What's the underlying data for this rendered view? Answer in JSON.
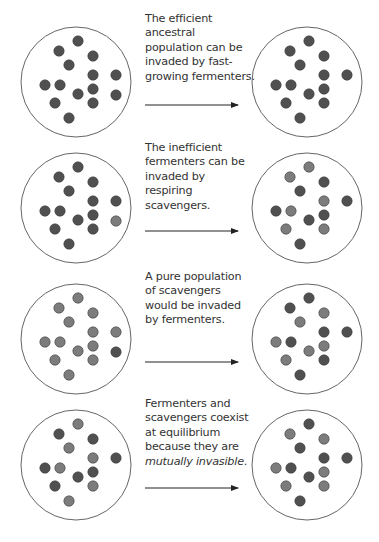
{
  "colors": {
    "fermenter": "#505050",
    "scavenger": "#7c7c7c",
    "circle_stroke": "#666666",
    "arrow": "#222222"
  },
  "layout": {
    "left_cx": 76,
    "right_cx": 307,
    "row_cy": [
      82,
      208,
      339,
      465
    ],
    "circle_r": 55,
    "dot_r": 5.2,
    "arrow_x1": 145,
    "arrow_x2": 238,
    "arrow_dy": 23,
    "caption_top": [
      12,
      141,
      270,
      397
    ]
  },
  "positions": [
    [
      2,
      -41
    ],
    [
      -17,
      -31
    ],
    [
      17,
      -26
    ],
    [
      -7,
      -17
    ],
    [
      17,
      -7
    ],
    [
      40,
      -7
    ],
    [
      -31,
      3
    ],
    [
      -16,
      3
    ],
    [
      2,
      12
    ],
    [
      17,
      7
    ],
    [
      40,
      13
    ],
    [
      -21,
      21
    ],
    [
      17,
      21
    ],
    [
      -7,
      36
    ]
  ],
  "rows": [
    {
      "caption": {
        "lines": [
          "The efficient",
          "ancestral",
          "population can be",
          "invaded by fast-",
          "growing fermenters."
        ],
        "italic_line": -1
      },
      "left": [
        "F",
        "F",
        "F",
        "F",
        "F",
        "F",
        "F",
        "F",
        "F",
        "F",
        "F",
        "F",
        "F",
        "F"
      ],
      "right": [
        "F",
        "F",
        "F",
        "F",
        "F",
        "F",
        "F",
        "F",
        "F",
        "F",
        "-",
        "F",
        "F",
        "F"
      ]
    },
    {
      "caption": {
        "lines": [
          "The inefficient",
          "fermenters can be",
          "invaded by",
          "respiring",
          "scavengers."
        ],
        "italic_line": -1
      },
      "left": [
        "F",
        "F",
        "F",
        "F",
        "F",
        "F",
        "F",
        "F",
        "F",
        "F",
        "S",
        "F",
        "F",
        "F"
      ],
      "right": [
        "S",
        "S",
        "F",
        "F",
        "S",
        "F",
        "F",
        "S",
        "F",
        "F",
        "-",
        "S",
        "S",
        "F"
      ]
    },
    {
      "caption": {
        "lines": [
          "A pure population",
          "of scavengers",
          "would be invaded",
          "by fermenters."
        ],
        "italic_line": -1
      },
      "left": [
        "S",
        "S",
        "S",
        "S",
        "S",
        "S",
        "S",
        "S",
        "S",
        "S",
        "F",
        "S",
        "S",
        "S"
      ],
      "right": [
        "F",
        "F",
        "S",
        "S",
        "F",
        "F",
        "S",
        "F",
        "S",
        "S",
        "-",
        "S",
        "F",
        "F"
      ]
    },
    {
      "caption": {
        "lines": [
          "Fermenters and",
          "scavengers coexist",
          "at equilibrium",
          "because they are",
          "mutually invasible."
        ],
        "italic_line": 4
      },
      "left": [
        "S",
        "F",
        "F",
        "S",
        "S",
        "F",
        "F",
        "S",
        "F",
        "F",
        "-",
        "F",
        "S",
        "S"
      ],
      "right": [
        "F",
        "S",
        "S",
        "F",
        "F",
        "F",
        "S",
        "F",
        "F",
        "S",
        "-",
        "S",
        "S",
        "F"
      ]
    }
  ],
  "legend_codes": {
    "F": "fermenter",
    "S": "scavenger",
    "-": "absent"
  }
}
